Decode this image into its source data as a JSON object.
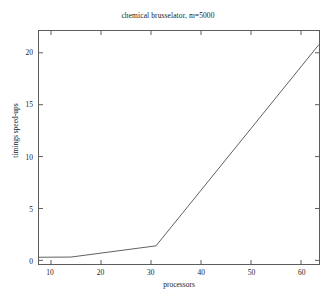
{
  "chart_data": {
    "type": "line",
    "title": "chemical brusselator, m=5000",
    "xlabel": "processors",
    "ylabel": "timings speed-ups",
    "xlim": [
      7.6,
      63.6
    ],
    "ylim": [
      -0.35,
      22.1
    ],
    "xticks": [
      10,
      20,
      30,
      40,
      50,
      60
    ],
    "xticklabels": [
      "10",
      "20",
      "30",
      "40",
      "50",
      "60"
    ],
    "yticks": [
      0,
      5,
      10,
      15,
      20
    ],
    "yticklabels": [
      "0",
      "5",
      "10",
      "15",
      "20"
    ],
    "grid": false,
    "legend": null,
    "series": [
      {
        "name": "speed-up",
        "color": "#4d4d4d",
        "x": [
          7.6,
          14.0,
          31.0,
          63.6
        ],
        "y": [
          0.3,
          0.32,
          1.4,
          20.8
        ]
      }
    ]
  },
  "figure": {
    "background_color": "#ffffff",
    "axes_color": "#5c5c5c",
    "text_color": "#1a1a1a"
  }
}
